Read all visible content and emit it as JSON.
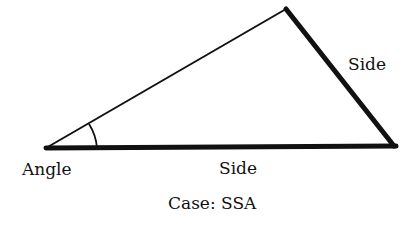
{
  "diagram": {
    "labels": {
      "angle": "Angle",
      "side_bottom": "Side",
      "side_right": "Side",
      "caption": "Case: SSA"
    },
    "vertices": {
      "left": [
        46,
        148
      ],
      "top": [
        286,
        8
      ],
      "right": [
        395,
        147
      ]
    },
    "colors": {
      "stroke": "#111111",
      "background": "#ffffff"
    }
  }
}
